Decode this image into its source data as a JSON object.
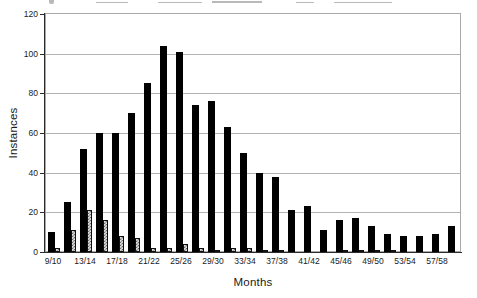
{
  "chart_data": {
    "type": "bar",
    "title": "",
    "xlabel": "Months",
    "ylabel": "Instances",
    "ylim": [
      0,
      120
    ],
    "yticks": [
      0,
      20,
      40,
      60,
      80,
      100,
      120
    ],
    "grid": "horizontal",
    "legend": "none",
    "categories": [
      "9/10",
      "11/12",
      "13/14",
      "15/16",
      "17/18",
      "19/20",
      "21/22",
      "23/24",
      "25/26",
      "27/28",
      "29/30",
      "31/32",
      "33/34",
      "35/36",
      "37/38",
      "39/40",
      "41/42",
      "43/44",
      "45/46",
      "47/48",
      "49/50",
      "51/52",
      "53/54",
      "55/56",
      "57/58",
      "59/60"
    ],
    "x_tick_labels": [
      "9/10",
      "13/14",
      "17/18",
      "21/22",
      "25/26",
      "29/30",
      "33/34",
      "37/38",
      "41/42",
      "45/46",
      "49/50",
      "53/54",
      "57/58"
    ],
    "x_label_every": 2,
    "series": [
      {
        "name": "solid-black-bars",
        "style": "solid",
        "color": "#000000",
        "values": [
          10,
          25,
          52,
          60,
          60,
          70,
          85,
          104,
          101,
          74,
          76,
          63,
          50,
          40,
          38,
          21,
          23,
          11,
          16,
          17,
          13,
          9,
          8,
          8,
          9,
          13
        ]
      },
      {
        "name": "hatched-gray-bars",
        "style": "checker-hatch",
        "color": "#e2e2e2",
        "hatch_color": "#6e6e6e",
        "values": [
          2,
          11,
          21,
          16,
          8,
          7,
          2,
          2,
          4,
          2,
          1,
          2,
          2,
          1,
          1,
          0,
          0,
          0,
          1,
          1,
          1,
          1,
          0,
          0,
          0,
          0
        ]
      }
    ]
  },
  "colors": {
    "background": "#ffffff",
    "gridline": "#b4b4b4",
    "plot_border": "#a9a9a9",
    "axis": "#2b2b2b",
    "text": "#1a1a1a"
  }
}
